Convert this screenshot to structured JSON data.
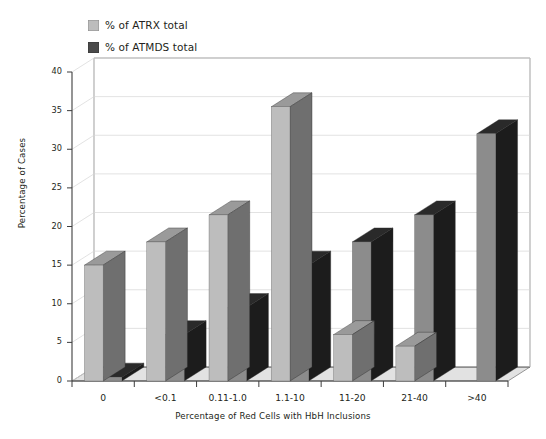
{
  "chart_data": {
    "type": "bar",
    "title": "",
    "xlabel": "Percentage of Red Cells with HbH Inclusions",
    "ylabel": "Percentage of Cases",
    "categories": [
      "0",
      "<0.1",
      "0.11-1.0",
      "1.1-10",
      "11-20",
      "21-40",
      ">40"
    ],
    "series": [
      {
        "name": "% of ATRX total",
        "color": "#bdbdbd",
        "values": [
          15,
          18,
          21.5,
          35.5,
          6,
          4.5,
          0
        ]
      },
      {
        "name": "% of ATMDS total",
        "color": "#8c8c8c",
        "values": [
          0.5,
          6,
          9.5,
          15,
          18,
          21.5,
          32
        ]
      }
    ],
    "ylim": [
      0,
      40
    ],
    "yticks": [
      0,
      5,
      10,
      15,
      20,
      25,
      30,
      35,
      40
    ],
    "ytick_labels": [
      "0",
      "5",
      "10",
      "15",
      "20",
      "25",
      "30",
      "35",
      "40"
    ],
    "grid": "horizontal",
    "legend_position": "top-left",
    "style": "3d-columns-grayscale"
  },
  "legend": {
    "items": [
      {
        "label": "% of ATRX total",
        "swatch": "#bdbdbd"
      },
      {
        "label": "% of ATMDS total",
        "swatch": "#4a4a4a"
      }
    ]
  },
  "colors": {
    "background": "#ffffff",
    "gridline": "#d6d6d6",
    "axis": "#6e6e6e",
    "floor": "#e2e2e2",
    "series1_face": "#bdbdbd",
    "series1_side": "#6f6f6f",
    "series1_top": "#9a9a9a",
    "series2_face": "#8c8c8c",
    "series2_side": "#1c1c1c",
    "series2_top": "#2a2a2a",
    "text": "#231f20"
  }
}
